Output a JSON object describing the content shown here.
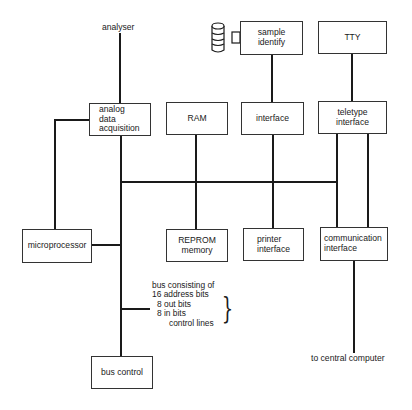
{
  "diagram": {
    "type": "block-diagram",
    "labels": {
      "analyser": "analyser",
      "to_central_computer": "to central computer"
    },
    "blocks": {
      "analog": [
        "analog",
        "data",
        "acquisition"
      ],
      "ram": [
        "RAM"
      ],
      "interface": [
        "interface"
      ],
      "teletype": [
        "teletype",
        "interface"
      ],
      "sample": [
        "sample",
        "identify"
      ],
      "tty": [
        "TTY"
      ],
      "microprocessor": [
        "microprocessor"
      ],
      "reprom": [
        "REPROM",
        "memory"
      ],
      "printer": [
        "printer",
        "interface"
      ],
      "communication": [
        "communication",
        "interface"
      ],
      "bus_control": [
        "bus control"
      ]
    },
    "bus_note": {
      "lines": [
        "bus consisting of",
        "16 address bits",
        "8 out bits",
        "8 in bits",
        "control lines"
      ],
      "brace": "}"
    },
    "icons": {
      "sample_device": "cylinder-sample-icon"
    },
    "colors": {
      "line": "#1a1a1a",
      "box_border": "#333333",
      "background": "#ffffff"
    }
  }
}
